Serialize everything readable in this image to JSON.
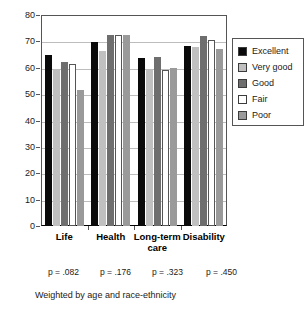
{
  "chart_data": {
    "type": "bar",
    "title": "",
    "subtitle": "",
    "xlabel": "",
    "ylabel": "",
    "ylim": [
      0,
      80
    ],
    "ytick_step": 10,
    "yticks": [
      0,
      10,
      20,
      30,
      40,
      50,
      60,
      70,
      80
    ],
    "ytick_labels": [
      "0",
      "10",
      "20",
      "30",
      "40",
      "50",
      "60",
      "70",
      "80"
    ],
    "grid": true,
    "grid_axis": "y",
    "legend_position": "right",
    "categories": [
      "Life",
      "Health",
      "Long-term care",
      "Disability"
    ],
    "category_labels": [
      [
        "Life"
      ],
      [
        "Health"
      ],
      [
        "Long-term",
        "care"
      ],
      [
        "Disability"
      ]
    ],
    "series": [
      {
        "name": "Excellent",
        "color": "#0a0a0a",
        "values": [
          65.0,
          69.7,
          63.6,
          68.4
        ]
      },
      {
        "name": "Very good",
        "color": "#c0c0c0",
        "values": [
          59.0,
          66.5,
          59.3,
          67.9
        ]
      },
      {
        "name": "Good",
        "color": "#6e6e6e",
        "values": [
          62.2,
          72.3,
          64.2,
          72.2
        ]
      },
      {
        "name": "Fair",
        "color": "#ffffff",
        "values": [
          61.6,
          72.3,
          59.3,
          70.6
        ]
      },
      {
        "name": "Poor",
        "color": "#9a9a9a",
        "values": [
          51.6,
          72.3,
          60.1,
          67.2
        ]
      }
    ],
    "annotations": {
      "p_values": [
        "p = .082",
        "p = .176",
        "p = .323",
        "p = .450"
      ],
      "footnote": "Weighted by age and race-ethnicity"
    }
  },
  "legend": {
    "entries": [
      {
        "label": "Excellent",
        "color": "#0a0a0a"
      },
      {
        "label": "Very good",
        "color": "#c0c0c0"
      },
      {
        "label": "Good",
        "color": "#6e6e6e"
      },
      {
        "label": "Fair",
        "color": "#ffffff"
      },
      {
        "label": "Poor",
        "color": "#9a9a9a"
      }
    ]
  }
}
